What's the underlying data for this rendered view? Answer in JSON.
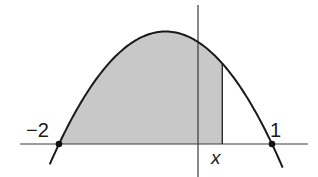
{
  "figure": {
    "colors": {
      "background": "#ffffff",
      "shade": "#c8c8c8",
      "curve": "#1a1a1a",
      "axes": "#3a3a3a"
    },
    "labels": {
      "left_root": "−2",
      "right_root": "1",
      "variable": "x"
    },
    "function": "y = -(t + 2)(t - 1)",
    "roots": [
      -2,
      1
    ],
    "vertex": [
      -0.5,
      2.25
    ],
    "shaded_interval": [
      "-2",
      "x"
    ],
    "x_marker_value": 0.3
  }
}
